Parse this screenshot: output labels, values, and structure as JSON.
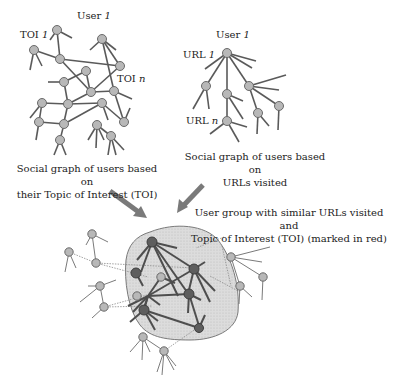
{
  "toi_graph": {
    "user_label": "User",
    "user_index": "1",
    "toi_first_label": "TOI",
    "toi_first_index": "1",
    "toi_last_label": "TOI",
    "toi_last_index": "n",
    "caption_line1": "Social graph of  users based on",
    "caption_line2": "their Topic of  Interest (TOI)"
  },
  "url_graph": {
    "user_label": "User",
    "user_index": "1",
    "url_first_label": "URL",
    "url_first_index": "1",
    "url_last_label": "URL",
    "url_last_index": "n",
    "caption_line1": "Social graph of  users based on",
    "caption_line2": "URLs  visited"
  },
  "merged_graph": {
    "caption_line1": "User group with similar URLs visited and",
    "caption_line2": "Topic of  Interest (TOI) (marked in red)"
  },
  "colors": {
    "node_fill": "#b8b8b8",
    "node_stroke": "#6a6a6a",
    "edge": "#5a5a5a",
    "highlight_node": "#5e5e5e",
    "cluster_fill": "#d9d9d9",
    "arrow": "#7a7a7a"
  }
}
